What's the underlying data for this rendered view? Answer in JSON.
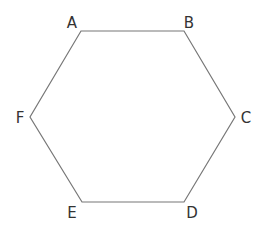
{
  "diagram": {
    "type": "regular-hexagon",
    "stroke_color": "#777777",
    "label_color": "#333333",
    "stroke_width": 1.2,
    "vertices": [
      {
        "label": "A",
        "x": 81,
        "y": 31,
        "label_x": 72,
        "label_y": 28,
        "anchor": "middle"
      },
      {
        "label": "B",
        "x": 184,
        "y": 31,
        "label_x": 189,
        "label_y": 28,
        "anchor": "middle"
      },
      {
        "label": "C",
        "x": 235,
        "y": 117,
        "label_x": 246,
        "label_y": 123,
        "anchor": "middle"
      },
      {
        "label": "D",
        "x": 184,
        "y": 202,
        "label_x": 192,
        "label_y": 218,
        "anchor": "middle"
      },
      {
        "label": "E",
        "x": 82,
        "y": 202,
        "label_x": 72,
        "label_y": 218,
        "anchor": "middle"
      },
      {
        "label": "F",
        "x": 30,
        "y": 117,
        "label_x": 20,
        "label_y": 123,
        "anchor": "middle"
      }
    ]
  }
}
